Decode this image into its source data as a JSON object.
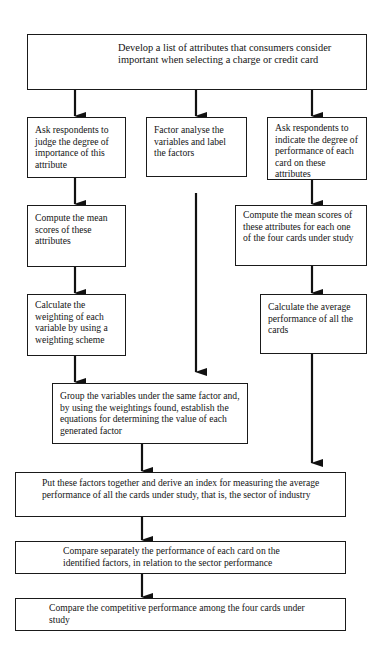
{
  "diagram": {
    "type": "flowchart",
    "nodes": {
      "top": {
        "text": "Develop a list of attributes that consumers consider important when selecting a charge or credit card"
      },
      "left1": {
        "text": "Ask respondents to judge the degree of importance of this attribute"
      },
      "mid1": {
        "text": "Factor analyse the variables and label the factors"
      },
      "right1": {
        "text": "Ask respondents to indicate the degree of performance of each card on these attributes"
      },
      "left2": {
        "text": "Compute the mean scores of these attributes"
      },
      "right2": {
        "text": "Compute the mean scores of these attributes for each one of the four cards under study"
      },
      "left3": {
        "text": "Calculate the weighting of each variable by using a weighting scheme"
      },
      "right3": {
        "text": "Calculate the average performance of all the cards"
      },
      "group": {
        "text": "Group the variables under the same factor and, by using the weightings found, establish the equations for determining the value of each generated factor"
      },
      "index": {
        "text": "Put these factors together and derive an index for measuring the average performance of all the cards under study, that is, the sector of industry"
      },
      "compare1": {
        "text": "Compare separately the performance of each card on the identified factors, in relation to the sector performance"
      },
      "compare2": {
        "text": "Compare the competitive performance among the four cards under study"
      }
    },
    "edges": [
      [
        "top",
        "left1"
      ],
      [
        "top",
        "mid1"
      ],
      [
        "top",
        "right1"
      ],
      [
        "left1",
        "left2"
      ],
      [
        "left2",
        "left3"
      ],
      [
        "left3",
        "group"
      ],
      [
        "mid1",
        "group"
      ],
      [
        "right1",
        "right2"
      ],
      [
        "right2",
        "right3"
      ],
      [
        "right3",
        "index"
      ],
      [
        "group",
        "index"
      ],
      [
        "index",
        "compare1"
      ],
      [
        "compare1",
        "compare2"
      ]
    ]
  }
}
